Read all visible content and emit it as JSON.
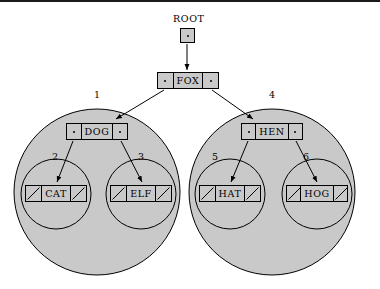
{
  "figure": {
    "kind": "binary-search-tree-linked-representation",
    "background_color": "#ffffff",
    "node_fill_color": "#c9c9c9",
    "circle_fill_color": "#c9c9c9",
    "stroke_color": "#000000"
  },
  "root_pointer": {
    "label": "ROOT",
    "box": {
      "x": 180,
      "y": 26,
      "size": 15
    },
    "label_pos": {
      "x": 173,
      "y": 12
    }
  },
  "nodes": [
    {
      "id": "fox",
      "key": "FOX",
      "x": 157,
      "y": 70,
      "width": 62,
      "left_null": false,
      "right_null": false
    },
    {
      "id": "dog",
      "key": "DOG",
      "x": 66,
      "y": 121,
      "width": 62,
      "left_null": false,
      "right_null": false
    },
    {
      "id": "hen",
      "key": "HEN",
      "x": 241,
      "y": 121,
      "width": 62,
      "left_null": false,
      "right_null": false
    },
    {
      "id": "cat",
      "key": "CAT",
      "x": 25,
      "y": 183,
      "width": 62,
      "left_null": true,
      "right_null": true
    },
    {
      "id": "elf",
      "key": "ELF",
      "x": 110,
      "y": 183,
      "width": 62,
      "left_null": true,
      "right_null": true
    },
    {
      "id": "hat",
      "key": "HAT",
      "x": 199,
      "y": 183,
      "width": 62,
      "left_null": true,
      "right_null": true
    },
    {
      "id": "hog",
      "key": "HOG",
      "x": 286,
      "y": 183,
      "width": 62,
      "left_null": true,
      "right_null": true
    }
  ],
  "subtree_circles": [
    {
      "id": "subtree-1",
      "label": "1",
      "cx": 97,
      "cy": 190,
      "r": 83,
      "label_pos": {
        "x": 94,
        "y": 88
      }
    },
    {
      "id": "subtree-4",
      "label": "4",
      "cx": 272,
      "cy": 190,
      "r": 83,
      "label_pos": {
        "x": 269,
        "y": 88
      }
    },
    {
      "id": "subtree-2",
      "label": "2",
      "cx": 56,
      "cy": 192,
      "r": 35,
      "label_pos": {
        "x": 52,
        "y": 150
      }
    },
    {
      "id": "subtree-3",
      "label": "3",
      "cx": 141,
      "cy": 192,
      "r": 35,
      "label_pos": {
        "x": 138,
        "y": 150
      }
    },
    {
      "id": "subtree-5",
      "label": "5",
      "cx": 230,
      "cy": 192,
      "r": 35,
      "label_pos": {
        "x": 212,
        "y": 150
      }
    },
    {
      "id": "subtree-6",
      "label": "6",
      "cx": 317,
      "cy": 192,
      "r": 35,
      "label_pos": {
        "x": 303,
        "y": 150
      }
    }
  ],
  "arrows": [
    {
      "id": "root-to-fox",
      "from": {
        "x": 187,
        "y": 42
      },
      "to": {
        "x": 187,
        "y": 68
      }
    },
    {
      "id": "fox-left-to-dog",
      "from": {
        "x": 164,
        "y": 88
      },
      "to": {
        "x": 116,
        "y": 117
      }
    },
    {
      "id": "fox-right-to-hen",
      "from": {
        "x": 212,
        "y": 88
      },
      "to": {
        "x": 253,
        "y": 117
      }
    },
    {
      "id": "dog-left-to-cat",
      "from": {
        "x": 73,
        "y": 139
      },
      "to": {
        "x": 57,
        "y": 180
      }
    },
    {
      "id": "dog-right-to-elf",
      "from": {
        "x": 121,
        "y": 139
      },
      "to": {
        "x": 142,
        "y": 180
      }
    },
    {
      "id": "hen-left-to-hat",
      "from": {
        "x": 248,
        "y": 139
      },
      "to": {
        "x": 231,
        "y": 180
      }
    },
    {
      "id": "hen-right-to-hog",
      "from": {
        "x": 296,
        "y": 139
      },
      "to": {
        "x": 317,
        "y": 180
      }
    }
  ]
}
